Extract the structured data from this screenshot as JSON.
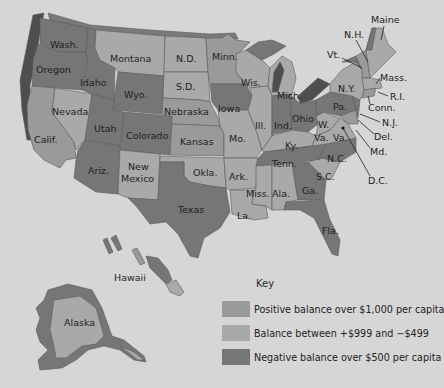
{
  "colors": {
    "background": "#d6d6d6",
    "positive": "#9a9a9a",
    "balanced": "#a9a9a9",
    "negative": "#767676",
    "coast_shadow": "#4e4e4e"
  },
  "key": {
    "title": "Key",
    "items": [
      {
        "id": "positive",
        "label": "Positive balance over $1,000 per capita",
        "color": "#9a9a9a"
      },
      {
        "id": "balanced",
        "label": "Balance between +$999 and −$499",
        "color": "#a9a9a9"
      },
      {
        "id": "negative",
        "label": "Negative balance over $500 per capita",
        "color": "#767676"
      }
    ]
  },
  "states": {
    "wash": "Wash.",
    "oregon": "Oregon",
    "calif": "Calif.",
    "nevada": "Nevada",
    "idaho": "Idaho",
    "montana": "Montana",
    "wyo": "Wyo.",
    "utah": "Utah",
    "colorado": "Colorado",
    "ariz": "Ariz.",
    "new_mexico_1": "New",
    "new_mexico_2": "Mexico",
    "nd": "N.D.",
    "sd": "S.D.",
    "nebraska": "Nebraska",
    "kansas": "Kansas",
    "okla": "Okla.",
    "texas": "Texas",
    "minn": "Minn.",
    "iowa": "Iowa",
    "mo": "Mo.",
    "ark": "Ark.",
    "la": "La.",
    "wis": "Wis.",
    "ill": "Ill.",
    "mich": "Mich.",
    "ind": "Ind.",
    "ohio": "Ohio",
    "ky": "Ky.",
    "tenn": "Tenn.",
    "miss": "Miss.",
    "ala": "Ala.",
    "ga": "Ga.",
    "fla": "Fla.",
    "sc": "S.C.",
    "nc": "N.C.",
    "va": "Va.",
    "wva_1": "W.",
    "wva_2": "Va.",
    "pa": "Pa.",
    "ny": "N.Y.",
    "vt": "Vt.",
    "nh": "N.H.",
    "maine": "Maine",
    "mass": "Mass.",
    "ri": "R.I.",
    "conn": "Conn.",
    "nj": "N.J.",
    "del": "Del.",
    "md": "Md.",
    "dc": "D.C.",
    "hawaii": "Hawaii",
    "alaska": "Alaska"
  }
}
